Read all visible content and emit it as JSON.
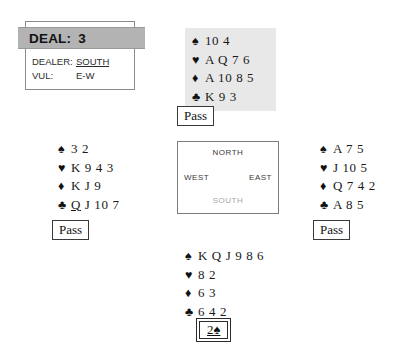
{
  "deal_info": {
    "deal_label": "DEAL:",
    "deal_number": "3",
    "dealer_label": "DEALER:",
    "dealer_value": "SOUTH",
    "vul_label": "VUL:",
    "vul_value": "E-W"
  },
  "compass": {
    "north": "NORTH",
    "west": "WEST",
    "east": "EAST",
    "south": "SOUTH"
  },
  "suits": {
    "spade": "♠",
    "heart": "♥",
    "diamond": "♦",
    "club": "♣"
  },
  "hands": {
    "north": {
      "seat": "NORTH",
      "spades": "10 4",
      "hearts": "A Q 7 6",
      "diamonds": "A 10 8 5",
      "clubs": "K 9 3"
    },
    "west": {
      "seat": "WEST",
      "spades": "3 2",
      "hearts": "K 9 4 3",
      "diamonds": "K J 9",
      "clubs_lead": "Q",
      "clubs_rest": " J 10 7"
    },
    "east": {
      "seat": "EAST",
      "spades": "A 7 5",
      "hearts": "J 10 5",
      "diamonds": "Q 7 4 2",
      "clubs": "A 8 5"
    },
    "south": {
      "seat": "SOUTH",
      "spades": "K Q J 9 8 6",
      "hearts": "8 2",
      "diamonds": "6 3",
      "clubs": "6 4 2"
    }
  },
  "bids": {
    "north": "Pass",
    "west": "Pass",
    "east": "Pass",
    "south": "2♠"
  },
  "colors": {
    "header_bar": "#b3b3b3",
    "north_hand_shade": "#e8e8e8",
    "text": "#1a1a1a",
    "compass_south_text": "#a6a6a6"
  }
}
